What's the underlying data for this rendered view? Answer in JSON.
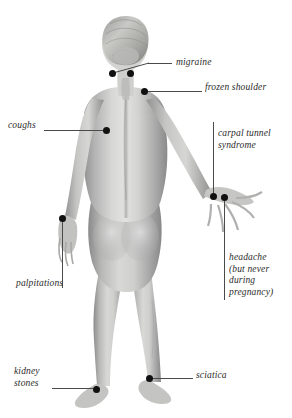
{
  "figure": {
    "view": "posterior (back) view of a standing female figure",
    "background_color": "#ffffff",
    "marker_color": "#111111",
    "leader_color": "#4a4a4a",
    "text_color": "#2b2b2b"
  },
  "labels": [
    {
      "id": "migraine",
      "text": "migraine",
      "lines": [
        "migraine"
      ],
      "side": "right",
      "text_x": 176,
      "text_y": 57,
      "leader": {
        "type": "angled",
        "x1": 113,
        "y1": 72,
        "x2": 148,
        "y2": 63,
        "x3": 172,
        "y3": 63
      },
      "markers": [
        {
          "x": 112,
          "y": 73
        },
        {
          "x": 130,
          "y": 73
        }
      ]
    },
    {
      "id": "frozen-shoulder",
      "text": "frozen shoulder",
      "lines": [
        "frozen shoulder"
      ],
      "side": "right",
      "text_x": 205,
      "text_y": 82,
      "leader": {
        "type": "horizontal",
        "x1": 147,
        "y1": 91,
        "x2": 202,
        "y2": 91
      },
      "markers": [
        {
          "x": 144,
          "y": 91
        }
      ]
    },
    {
      "id": "carpal-tunnel-syndrome",
      "text": "carpal tunnel syndrome",
      "lines": [
        "carpal tunnel",
        "syndrome"
      ],
      "side": "right",
      "text_x": 218,
      "text_y": 128,
      "leader": {
        "type": "vertical",
        "x1": 213,
        "y1": 122,
        "x2": 213,
        "y2": 194
      },
      "markers": [
        {
          "x": 213,
          "y": 196
        }
      ]
    },
    {
      "id": "headache",
      "text": "headache (but never during pregnancy)",
      "lines": [
        "headache",
        "(but never",
        "during",
        "pregnancy)"
      ],
      "side": "right",
      "text_x": 229,
      "text_y": 252,
      "leader": {
        "type": "vertical",
        "x1": 224,
        "y1": 200,
        "x2": 224,
        "y2": 300
      },
      "markers": [
        {
          "x": 224,
          "y": 197
        }
      ]
    },
    {
      "id": "coughs",
      "text": "coughs",
      "lines": [
        "coughs"
      ],
      "side": "left",
      "text_x": 8,
      "text_y": 120,
      "leader": {
        "type": "horizontal",
        "x1": 44,
        "y1": 130,
        "x2": 104,
        "y2": 130
      },
      "markers": [
        {
          "x": 106,
          "y": 130
        }
      ]
    },
    {
      "id": "palpitations",
      "text": "palpitations",
      "lines": [
        "palpitations"
      ],
      "side": "left",
      "text_x": 16,
      "text_y": 278,
      "leader": {
        "type": "vertical",
        "x1": 62,
        "y1": 222,
        "x2": 62,
        "y2": 288
      },
      "markers": [
        {
          "x": 62,
          "y": 218
        }
      ]
    },
    {
      "id": "kidney-stones",
      "text": "kidney stones",
      "lines": [
        "kidney",
        "stones"
      ],
      "side": "left",
      "text_x": 14,
      "text_y": 366,
      "leader": {
        "type": "horizontal",
        "x1": 52,
        "y1": 388,
        "x2": 93,
        "y2": 388
      },
      "markers": [
        {
          "x": 96,
          "y": 389
        }
      ]
    },
    {
      "id": "sciatica",
      "text": "sciatica",
      "lines": [
        "sciatica"
      ],
      "side": "right",
      "text_x": 196,
      "text_y": 370,
      "leader": {
        "type": "horizontal",
        "x1": 152,
        "y1": 378,
        "x2": 193,
        "y2": 378
      },
      "markers": [
        {
          "x": 149,
          "y": 378
        }
      ]
    }
  ]
}
